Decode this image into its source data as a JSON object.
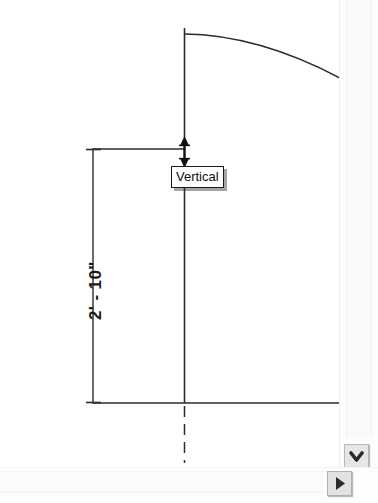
{
  "canvas": {
    "name": "drawing-canvas",
    "background": "#ffffff",
    "width": 340,
    "height": 468,
    "line_color": "#2b2b2b"
  },
  "dimension": {
    "label": "2' - 10\"",
    "orientation": "vertical",
    "text_color": "#1a1a1a"
  },
  "tooltip": {
    "label": "Vertical",
    "background": "#ffffff",
    "border_color": "#1b1b1b",
    "text_color": "#0d0d0d"
  },
  "geometry": {
    "wall_reference_line": "vertical",
    "arc_label": "curved-roof-profile",
    "floor_line": "horizontal",
    "centerline_style": "dashed"
  },
  "scrollbars": {
    "vertical": {
      "name": "vertical-scrollbar",
      "arrow_down_icon": "chevron-down-icon",
      "track_color": "#fafafa",
      "button_color": "#e6e6e6"
    },
    "horizontal": {
      "name": "horizontal-scrollbar",
      "arrow_right_icon": "chevron-right-icon",
      "track_color": "#fbfbfb",
      "button_color": "#e2e2e2"
    }
  }
}
